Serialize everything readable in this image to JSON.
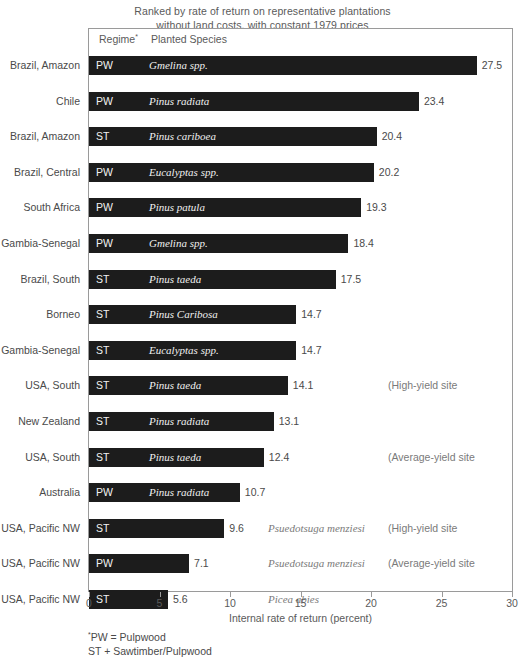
{
  "title": {
    "line1": "Ranked by rate of return on representative plantations",
    "line2": "without land costs, with constant 1979 prices"
  },
  "columns": {
    "regime": "Regime",
    "regime_marker": "*",
    "species": "Planted Species"
  },
  "axis": {
    "title": "Internal rate of return (percent)",
    "ticks": [
      "0",
      "5",
      "10",
      "15",
      "20",
      "25",
      "30"
    ],
    "min": 0,
    "max": 30
  },
  "footnote": {
    "marker": "*",
    "line1": "PW = Pulpwood",
    "line2": "ST + Sawtimber/Pulpwood"
  },
  "colors": {
    "bar": "#1c1c1c",
    "bar_text": "#f0f0f0",
    "frame": "#9a9a9a",
    "text": "#4a4a4a",
    "muted_text": "#7a7a7a"
  },
  "chart_data": {
    "type": "bar",
    "orientation": "horizontal",
    "title": "Ranked by rate of return on representative plantations without land costs, with constant 1979 prices",
    "xlabel": "Internal rate of return (percent)",
    "ylabel": "",
    "xlim": [
      0,
      30
    ],
    "xticks": [
      0,
      5,
      10,
      15,
      20,
      25,
      30
    ],
    "grid": false,
    "legend": "none",
    "categories": [
      "Brazil, Amazon",
      "Chile",
      "Brazil, Amazon",
      "Brazil, Central",
      "South Africa",
      "Gambia-Senegal",
      "Brazil, South",
      "Borneo",
      "Gambia-Senegal",
      "USA, South",
      "New Zealand",
      "USA, South",
      "Australia",
      "USA, Pacific NW",
      "USA, Pacific NW",
      "USA, Pacific NW"
    ],
    "values": [
      27.5,
      23.4,
      20.4,
      20.2,
      19.3,
      18.4,
      17.5,
      14.7,
      14.7,
      14.1,
      13.1,
      12.4,
      10.7,
      9.6,
      7.1,
      5.6
    ],
    "rows": [
      {
        "location": "Brazil, Amazon",
        "regime": "PW",
        "species": "Gmelina spp.",
        "value": 27.5,
        "value_label": "27.5",
        "species_inside": true,
        "note": ""
      },
      {
        "location": "Chile",
        "regime": "PW",
        "species": "Pinus radiata",
        "value": 23.4,
        "value_label": "23.4",
        "species_inside": true,
        "note": ""
      },
      {
        "location": "Brazil, Amazon",
        "regime": "ST",
        "species": "Pinus cariboea",
        "value": 20.4,
        "value_label": "20.4",
        "species_inside": true,
        "note": ""
      },
      {
        "location": "Brazil, Central",
        "regime": "PW",
        "species": "Eucalyptas spp.",
        "value": 20.2,
        "value_label": "20.2",
        "species_inside": true,
        "note": ""
      },
      {
        "location": "South Africa",
        "regime": "PW",
        "species": "Pinus patula",
        "value": 19.3,
        "value_label": "19.3",
        "species_inside": true,
        "note": ""
      },
      {
        "location": "Gambia-Senegal",
        "regime": "PW",
        "species": "Gmelina spp.",
        "value": 18.4,
        "value_label": "18.4",
        "species_inside": true,
        "note": ""
      },
      {
        "location": "Brazil, South",
        "regime": "ST",
        "species": "Pinus taeda",
        "value": 17.5,
        "value_label": "17.5",
        "species_inside": true,
        "note": ""
      },
      {
        "location": "Borneo",
        "regime": "ST",
        "species": "Pinus Caribosa",
        "value": 14.7,
        "value_label": "14.7",
        "species_inside": true,
        "note": ""
      },
      {
        "location": "Gambia-Senegal",
        "regime": "ST",
        "species": "Eucalyptas spp.",
        "value": 14.7,
        "value_label": "14.7",
        "species_inside": true,
        "note": ""
      },
      {
        "location": "USA, South",
        "regime": "ST",
        "species": "Pinus taeda",
        "value": 14.1,
        "value_label": "14.1",
        "species_inside": true,
        "note": "(High-yield site"
      },
      {
        "location": "New Zealand",
        "regime": "ST",
        "species": "Pinus radiata",
        "value": 13.1,
        "value_label": "13.1",
        "species_inside": true,
        "note": ""
      },
      {
        "location": "USA, South",
        "regime": "ST",
        "species": "Pinus taeda",
        "value": 12.4,
        "value_label": "12.4",
        "species_inside": true,
        "note": "(Average-yield site"
      },
      {
        "location": "Australia",
        "regime": "PW",
        "species": "Pinus radiata",
        "value": 10.7,
        "value_label": "10.7",
        "species_inside": true,
        "note": ""
      },
      {
        "location": "USA, Pacific NW",
        "regime": "ST",
        "species": "Psuedotsuga menziesi",
        "value": 9.6,
        "value_label": "9.6",
        "species_inside": false,
        "note": "(High-yield site"
      },
      {
        "location": "USA, Pacific NW",
        "regime": "PW",
        "species": "Psuedotsuga menziesi",
        "value": 7.1,
        "value_label": "7.1",
        "species_inside": false,
        "note": "(Average-yield site"
      },
      {
        "location": "USA, Pacific NW",
        "regime": "ST",
        "species": "Picea abies",
        "value": 5.6,
        "value_label": "5.6",
        "species_inside": false,
        "note": ""
      }
    ]
  }
}
